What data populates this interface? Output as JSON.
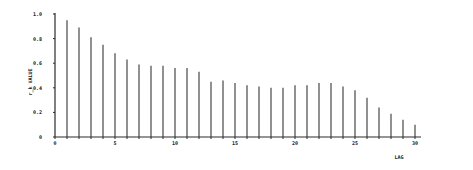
{
  "chart_data": {
    "type": "bar",
    "title": "",
    "xlabel": "LAG",
    "ylabel": "r_k VALUE",
    "xlim": [
      0,
      30
    ],
    "ylim": [
      0,
      1.0
    ],
    "grid": false,
    "legend": "none",
    "x_ticks": [
      0,
      5,
      10,
      15,
      20,
      25,
      30
    ],
    "x_tick_labels": [
      "0",
      "5",
      "10",
      "15",
      "20",
      "25",
      "30"
    ],
    "y_ticks": [
      0,
      0.2,
      0.4,
      0.6,
      0.8,
      1.0
    ],
    "y_tick_labels": [
      "0",
      "0.2",
      "0.4",
      "0.6",
      "0.8",
      "1.0"
    ],
    "x": [
      1,
      2,
      3,
      4,
      5,
      6,
      7,
      8,
      9,
      10,
      11,
      12,
      13,
      14,
      15,
      16,
      17,
      18,
      19,
      20,
      21,
      22,
      23,
      24,
      25,
      26,
      27,
      28,
      29,
      30
    ],
    "values": [
      0.95,
      0.89,
      0.81,
      0.75,
      0.68,
      0.63,
      0.59,
      0.58,
      0.58,
      0.56,
      0.56,
      0.53,
      0.45,
      0.46,
      0.44,
      0.42,
      0.41,
      0.4,
      0.4,
      0.42,
      0.42,
      0.44,
      0.44,
      0.41,
      0.38,
      0.32,
      0.24,
      0.19,
      0.14,
      0.1
    ],
    "series": [
      {
        "name": "r_k",
        "values": [
          0.95,
          0.89,
          0.81,
          0.75,
          0.68,
          0.63,
          0.59,
          0.58,
          0.58,
          0.56,
          0.56,
          0.53,
          0.45,
          0.46,
          0.44,
          0.42,
          0.41,
          0.4,
          0.4,
          0.42,
          0.42,
          0.44,
          0.44,
          0.41,
          0.38,
          0.32,
          0.24,
          0.19,
          0.14,
          0.1
        ]
      }
    ]
  }
}
